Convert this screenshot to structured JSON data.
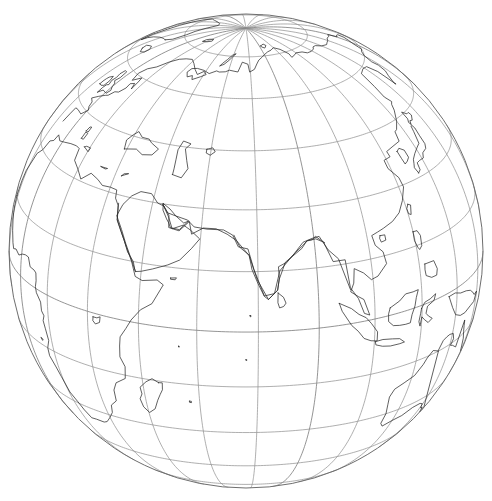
{
  "figure": {
    "background_color": "#ffffff",
    "width": 492,
    "height": 501
  },
  "projection": {
    "type": "orthographic",
    "center_longitude": 72,
    "center_latitude": 20,
    "rotation": 0,
    "screen_center_x": 246,
    "screen_center_y": 251,
    "radius_px": 237,
    "visible_hemisphere_label": "Eastern Hemisphere"
  },
  "graticule": {
    "meridian_interval_degrees": 15,
    "parallel_interval_degrees": 15,
    "line_color": "#8c8c8c",
    "line_width": 0.7,
    "meridians_degrees": [
      -180,
      -165,
      -150,
      -135,
      -120,
      -105,
      -90,
      -75,
      -60,
      -45,
      -30,
      -15,
      0,
      15,
      30,
      45,
      60,
      75,
      90,
      105,
      120,
      135,
      150,
      165
    ],
    "parallels_degrees": [
      -75,
      -60,
      -45,
      -30,
      -15,
      0,
      15,
      30,
      45,
      60,
      75
    ],
    "equator_degrees": 0,
    "pole_visible": "north"
  },
  "limb": {
    "color": "#6e6e6e",
    "line_width": 1.0,
    "shape": "circle"
  },
  "coastlines": {
    "color": "#2b2b2b",
    "line_width": 0.75,
    "regions_visible": [
      "Europe",
      "Mediterranean Sea",
      "Africa",
      "Madagascar",
      "Arabian Peninsula",
      "Middle East",
      "Caspian Sea",
      "India",
      "Sri Lanka",
      "Southeast Asia",
      "Indonesia",
      "Philippines",
      "China",
      "Japan",
      "Korea",
      "Siberia",
      "Arctic Ocean",
      "Australia (northwest)",
      "New Guinea",
      "Greenland (edge)"
    ]
  },
  "chart_data": {
    "type": "map",
    "projection": "orthographic",
    "center": [
      72,
      20
    ],
    "graticule_interval": 15,
    "xlabel": "",
    "ylabel": "",
    "grid": true,
    "legend": "none"
  }
}
